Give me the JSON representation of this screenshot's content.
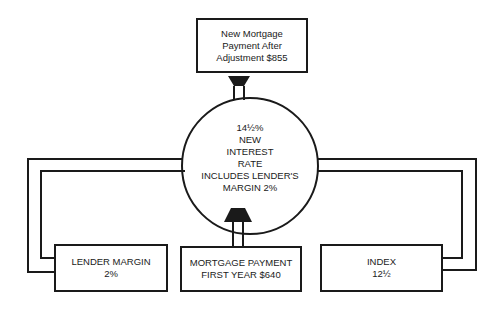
{
  "diagram": {
    "top_box": {
      "lines": [
        "New Mortgage",
        "Payment After",
        "Adjustment $855"
      ]
    },
    "center_circle": {
      "lines": [
        "14½%",
        "NEW",
        "INTEREST",
        "RATE",
        "INCLUDES LENDER'S",
        "MARGIN 2%"
      ]
    },
    "left_box": {
      "lines": [
        "LENDER MARGIN",
        "2%"
      ]
    },
    "middle_box": {
      "lines": [
        "MORTGAGE PAYMENT",
        "FIRST YEAR $640"
      ]
    },
    "right_box": {
      "lines": [
        "INDEX",
        "12½"
      ]
    }
  },
  "colors": {
    "line": "#1a1a1a",
    "background": "#ffffff"
  }
}
